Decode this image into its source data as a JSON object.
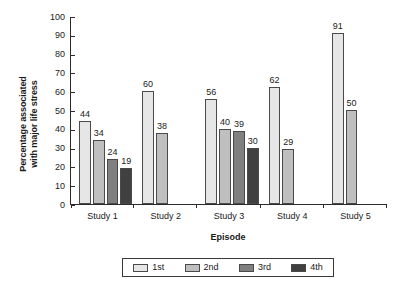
{
  "chart_data": {
    "type": "bar",
    "title": "",
    "subtitle": "",
    "xlabel": "Episode",
    "ylabel": "Percentage associated with major life stress",
    "ylabel_line1": "Percentage associated",
    "ylabel_line2": "with major life stress",
    "categories": [
      "Study 1",
      "Study 2",
      "Study 3",
      "Study 4",
      "Study 5"
    ],
    "series": [
      {
        "name": "1st",
        "color": "#e6e6e6",
        "values": [
          44,
          60,
          56,
          62,
          91
        ]
      },
      {
        "name": "2nd",
        "color": "#bfbfbf",
        "values": [
          34,
          38,
          40,
          29,
          50
        ]
      },
      {
        "name": "3rd",
        "color": "#808080",
        "values": [
          24,
          null,
          39,
          null,
          null
        ]
      },
      {
        "name": "4th",
        "color": "#404040",
        "values": [
          19,
          null,
          30,
          null,
          null
        ]
      }
    ],
    "ylim": [
      0,
      100
    ],
    "ytick_values": [
      100,
      90,
      80,
      70,
      60,
      50,
      40,
      30,
      20,
      10,
      0
    ],
    "ytick_labels": [
      "100",
      "90",
      "80",
      "70",
      "60",
      "50",
      "40",
      "30",
      "20",
      "10",
      "0"
    ],
    "grid": false,
    "legend_position": "bottom",
    "legend_entries": [
      "1st",
      "2nd",
      "3rd",
      "4th"
    ],
    "data_labels_shown": true,
    "groups": [
      {
        "category": "Study 1",
        "bars": [
          {
            "series": "1st",
            "value": 44,
            "label": "44",
            "color": "#e6e6e6"
          },
          {
            "series": "2nd",
            "value": 34,
            "label": "34",
            "color": "#bfbfbf"
          },
          {
            "series": "3rd",
            "value": 24,
            "label": "24",
            "color": "#808080"
          },
          {
            "series": "4th",
            "value": 19,
            "label": "19",
            "color": "#404040"
          }
        ]
      },
      {
        "category": "Study 2",
        "bars": [
          {
            "series": "1st",
            "value": 60,
            "label": "60",
            "color": "#e6e6e6"
          },
          {
            "series": "2nd",
            "value": 38,
            "label": "38",
            "color": "#bfbfbf"
          }
        ]
      },
      {
        "category": "Study 3",
        "bars": [
          {
            "series": "1st",
            "value": 56,
            "label": "56",
            "color": "#e6e6e6"
          },
          {
            "series": "2nd",
            "value": 40,
            "label": "40",
            "color": "#bfbfbf"
          },
          {
            "series": "3rd",
            "value": 39,
            "label": "39",
            "color": "#808080"
          },
          {
            "series": "4th",
            "value": 30,
            "label": "30",
            "color": "#404040"
          }
        ]
      },
      {
        "category": "Study 4",
        "bars": [
          {
            "series": "1st",
            "value": 62,
            "label": "62",
            "color": "#e6e6e6"
          },
          {
            "series": "2nd",
            "value": 29,
            "label": "29",
            "color": "#bfbfbf"
          }
        ]
      },
      {
        "category": "Study 5",
        "bars": [
          {
            "series": "1st",
            "value": 91,
            "label": "91",
            "color": "#e6e6e6"
          },
          {
            "series": "2nd",
            "value": 50,
            "label": "50",
            "color": "#bfbfbf"
          }
        ]
      }
    ]
  },
  "colors": {
    "axis": "#2b2b2b",
    "bar_outline": "#4a4a4a",
    "text": "#1a1a1a",
    "background": "#ffffff"
  }
}
